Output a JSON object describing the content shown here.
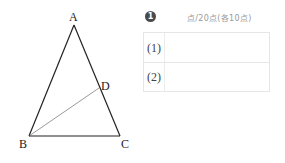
{
  "figure": {
    "type": "triangle",
    "points": {
      "A": {
        "label": "A",
        "x": 74,
        "y": 25
      },
      "B": {
        "label": "B",
        "x": 29,
        "y": 136
      },
      "C": {
        "label": "C",
        "x": 120,
        "y": 136
      },
      "D": {
        "label": "D",
        "x": 99,
        "y": 88
      }
    },
    "segments": [
      "AB",
      "AC",
      "BC",
      "BD"
    ]
  },
  "answer_sheet": {
    "question_number": "1",
    "score_text": "点/20点(各10点)",
    "rows": [
      {
        "label": "(1)",
        "value": ""
      },
      {
        "label": "(2)",
        "value": ""
      }
    ]
  }
}
